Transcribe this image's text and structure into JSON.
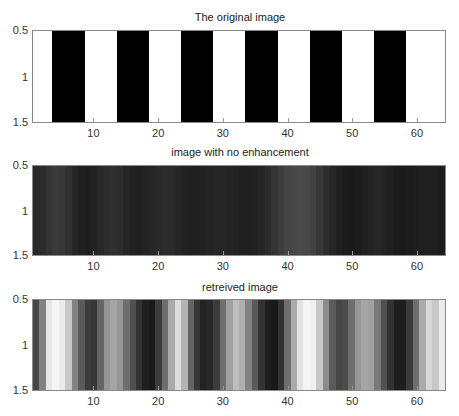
{
  "chart_data": [
    {
      "type": "heatmap",
      "title": "The original image",
      "xlabel": "",
      "ylabel": "",
      "xlim": [
        0.5,
        64.5
      ],
      "ylim": [
        0.5,
        1.5
      ],
      "x_ticks": [
        "10",
        "20",
        "30",
        "40",
        "50",
        "60"
      ],
      "y_ticks": [
        "0.5",
        "1",
        "1.5"
      ],
      "colormap": "gray",
      "values": [
        255,
        255,
        255,
        0,
        0,
        0,
        0,
        0,
        255,
        255,
        255,
        255,
        255,
        0,
        0,
        0,
        0,
        0,
        255,
        255,
        255,
        255,
        255,
        0,
        0,
        0,
        0,
        0,
        255,
        255,
        255,
        255,
        255,
        0,
        0,
        0,
        0,
        0,
        255,
        255,
        255,
        255,
        255,
        0,
        0,
        0,
        0,
        0,
        255,
        255,
        255,
        255,
        255,
        0,
        0,
        0,
        0,
        0,
        255,
        255,
        255,
        255,
        255,
        255
      ]
    },
    {
      "type": "heatmap",
      "title": "image with no enhancement",
      "xlabel": "",
      "ylabel": "",
      "xlim": [
        0.5,
        64.5
      ],
      "ylim": [
        0.5,
        1.5
      ],
      "x_ticks": [
        "10",
        "20",
        "30",
        "40",
        "50",
        "60"
      ],
      "y_ticks": [
        "0.5",
        "1",
        "1.5"
      ],
      "colormap": "gray",
      "values": [
        40,
        44,
        52,
        58,
        56,
        48,
        38,
        32,
        30,
        34,
        40,
        46,
        48,
        44,
        38,
        34,
        32,
        34,
        38,
        42,
        44,
        42,
        38,
        34,
        32,
        32,
        34,
        36,
        38,
        38,
        36,
        34,
        32,
        32,
        34,
        38,
        44,
        52,
        60,
        68,
        72,
        74,
        72,
        66,
        56,
        46,
        38,
        32,
        28,
        26,
        28,
        32,
        36,
        38,
        36,
        32,
        28,
        26,
        28,
        30,
        32,
        32,
        30,
        28
      ]
    },
    {
      "type": "heatmap",
      "title": "retreived image",
      "xlabel": "",
      "ylabel": "",
      "xlim": [
        0.5,
        64.5
      ],
      "ylim": [
        0.5,
        1.5
      ],
      "x_ticks": [
        "10",
        "20",
        "30",
        "40",
        "50",
        "60"
      ],
      "y_ticks": [
        "0.5",
        "1",
        "1.5"
      ],
      "colormap": "gray",
      "values": [
        70,
        130,
        230,
        245,
        235,
        200,
        130,
        90,
        60,
        55,
        100,
        150,
        165,
        150,
        110,
        80,
        50,
        30,
        25,
        60,
        110,
        170,
        220,
        180,
        100,
        55,
        35,
        40,
        60,
        110,
        160,
        190,
        175,
        130,
        90,
        50,
        30,
        25,
        50,
        110,
        170,
        225,
        245,
        240,
        200,
        140,
        90,
        70,
        75,
        110,
        150,
        165,
        160,
        120,
        80,
        50,
        30,
        30,
        60,
        110,
        170,
        215,
        200,
        235
      ]
    }
  ]
}
